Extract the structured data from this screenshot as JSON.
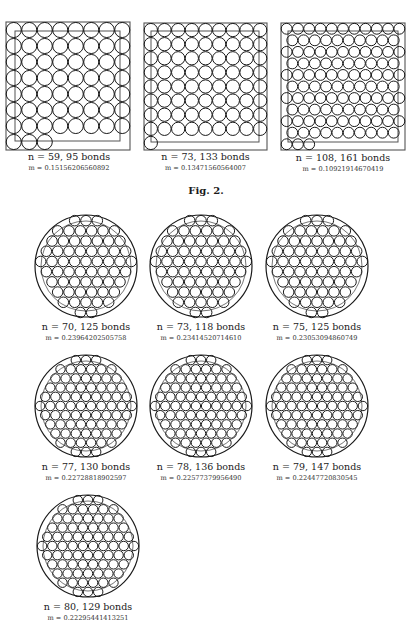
{
  "figure_label": "Fig. 2.",
  "square_packings": [
    {
      "caption_n": "n = 59, 95 bonds",
      "caption_m": "m = 0.15156206560892",
      "n": 59,
      "bonds": 95,
      "m": "0.15156206560892",
      "box": {
        "x": 6,
        "y": 22,
        "w": 124,
        "h": 128
      },
      "inner": {
        "x": 15,
        "y": 31,
        "w": 105,
        "h": 110
      },
      "grid": [
        8,
        8
      ]
    },
    {
      "caption_n": "n = 73, 133 bonds",
      "caption_m": "m = 0.13471560564007",
      "n": 73,
      "bonds": 133,
      "m": "0.13471560564007",
      "box": {
        "x": 144,
        "y": 23,
        "w": 123,
        "h": 127
      },
      "inner": {
        "x": 151,
        "y": 31,
        "w": 108,
        "h": 111
      },
      "grid": [
        9,
        9
      ]
    },
    {
      "caption_n": "n = 108, 161 bonds",
      "caption_m": "m = 0.10921914670419",
      "n": 108,
      "bonds": 161,
      "m": "0.10921914670419",
      "box": {
        "x": 281,
        "y": 23,
        "w": 124,
        "h": 127
      },
      "inner": {
        "x": 288,
        "y": 31,
        "w": 110,
        "h": 111
      },
      "grid": [
        11,
        11
      ]
    }
  ],
  "circle_packings": [
    {
      "caption_n": "n = 70, 125 bonds",
      "caption_m": "m = 0.23964202505758",
      "n": 70,
      "bonds": 125,
      "m": "0.23964202505758",
      "cx": 86,
      "cy": 266,
      "r": 51,
      "rows": 9
    },
    {
      "caption_n": "n = 73, 118 bonds",
      "caption_m": "m = 0.23414520714610",
      "n": 73,
      "bonds": 118,
      "m": "0.23414520714610",
      "cx": 201,
      "cy": 266,
      "r": 51,
      "rows": 9
    },
    {
      "caption_n": "n = 75, 125 bonds",
      "caption_m": "m = 0.23053094860749",
      "n": 75,
      "bonds": 125,
      "m": "0.23053094860749",
      "cx": 317,
      "cy": 266,
      "r": 51,
      "rows": 9
    },
    {
      "caption_n": "n = 77, 130 bonds",
      "caption_m": "m = 0.22728818902597",
      "n": 77,
      "bonds": 130,
      "m": "0.22728818902597",
      "cx": 86,
      "cy": 406,
      "r": 51,
      "rows": 10
    },
    {
      "caption_n": "n = 78, 136 bonds",
      "caption_m": "m = 0.22577379956490",
      "n": 78,
      "bonds": 136,
      "m": "0.22577379956490",
      "cx": 201,
      "cy": 406,
      "r": 51,
      "rows": 10
    },
    {
      "caption_n": "n = 79, 147 bonds",
      "caption_m": "m = 0.22447720830545",
      "n": 79,
      "bonds": 147,
      "m": "0.22447720830545",
      "cx": 317,
      "cy": 406,
      "r": 51,
      "rows": 10
    },
    {
      "caption_n": "n = 80, 129 bonds",
      "caption_m": "m = 0.22295441413251",
      "n": 80,
      "bonds": 129,
      "m": "0.22295441413251",
      "cx": 88,
      "cy": 546,
      "r": 51,
      "rows": 10
    }
  ],
  "colors": {
    "line": "#1a1a1a",
    "frame": "#555555",
    "background": "#ffffff"
  }
}
